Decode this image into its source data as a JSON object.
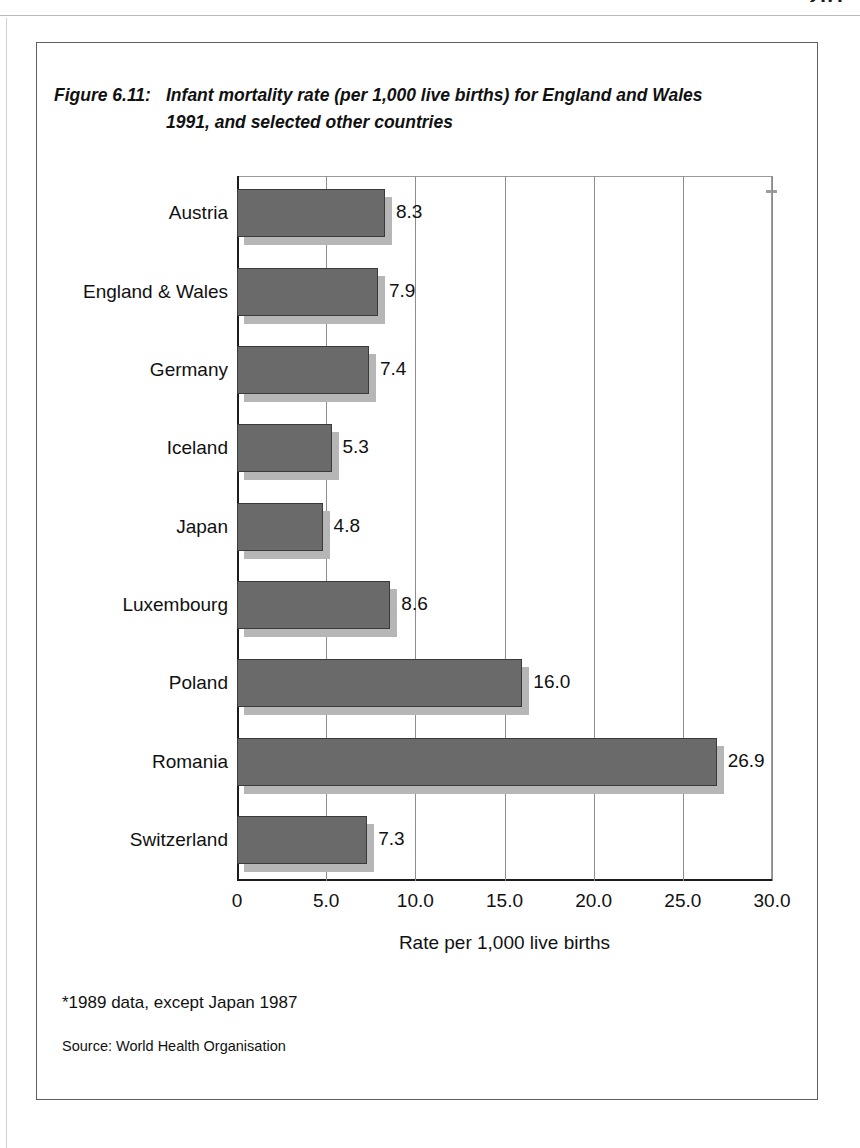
{
  "page": {
    "number": "201"
  },
  "figure": {
    "label": "Figure 6.11:",
    "title_line1": "Infant mortality rate (per 1,000 live births) for England and Wales",
    "title_line2": "1991, and selected other countries",
    "footnote": "*1989 data, except Japan 1987",
    "source": "Source: World Health Organisation"
  },
  "chart_data": {
    "type": "bar",
    "orientation": "horizontal",
    "xlabel": "Rate per 1,000 live births",
    "ylabel": "",
    "xlim": [
      0,
      30
    ],
    "grid": true,
    "legend": false,
    "bar_color": "#6a6a6a",
    "shadow_color": "#b6b6b6",
    "xticks": [
      "0",
      "5.0",
      "10.0",
      "15.0",
      "20.0",
      "25.0",
      "30.0"
    ],
    "xtick_values": [
      0,
      5,
      10,
      15,
      20,
      25,
      30
    ],
    "categories": [
      "Austria",
      "England & Wales",
      "Germany",
      "Iceland",
      "Japan",
      "Luxembourg",
      "Poland",
      "Romania",
      "Switzerland"
    ],
    "values": [
      8.3,
      7.9,
      7.4,
      5.3,
      4.8,
      8.6,
      16.0,
      26.9,
      7.3
    ],
    "value_labels": [
      "8.3",
      "7.9",
      "7.4",
      "5.3",
      "4.8",
      "8.6",
      "16.0",
      "26.9",
      "7.3"
    ]
  }
}
